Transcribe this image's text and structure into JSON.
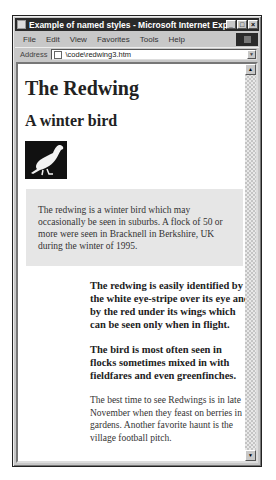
{
  "window": {
    "title": "Example of named styles - Microsoft Internet Explorer",
    "buttons": {
      "minimize": "_",
      "maximize": "□",
      "close": "×"
    }
  },
  "menubar": {
    "items": [
      {
        "label": "File"
      },
      {
        "label": "Edit"
      },
      {
        "label": "View"
      },
      {
        "label": "Favorites"
      },
      {
        "label": "Tools"
      },
      {
        "label": "Help"
      }
    ]
  },
  "addressbar": {
    "label": "Address",
    "value": "\\code\\redwing3.htm",
    "dropdown": "▼"
  },
  "scrollbar": {
    "up": "▲",
    "down": "▼"
  },
  "page": {
    "heading": "The Redwing",
    "subheading": "A winter bird",
    "image_alt": "redwing bird silhouette",
    "shaded_paragraph": "The redwing is a winter bird which may occasionally be seen in suburbs. A flock of 50 or more were seen in Bracknell in Berkshire, UK during the winter of 1995.",
    "bold_paragraph_1": "The redwing is easily identified by the white eye-stripe over its eye and by the red under its wings which can be seen only when in flight.",
    "bold_paragraph_2": "The bird is most often seen in flocks sometimes mixed in with fieldfares and even greenfinches.",
    "plain_paragraph": "The best time to see Redwings is in late November when they feast on berries in gardens. Another favorite haunt is the village football pitch."
  }
}
